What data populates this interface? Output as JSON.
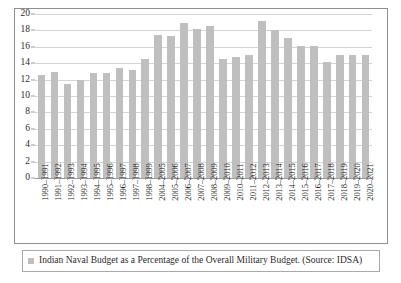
{
  "chart_data": {
    "type": "bar",
    "title": "",
    "xlabel": "",
    "ylabel": "",
    "ylim": [
      0,
      20
    ],
    "yticks": [
      0,
      2,
      4,
      6,
      8,
      10,
      12,
      14,
      16,
      18,
      20
    ],
    "grid": true,
    "legend_position": "bottom",
    "legend": [
      "Indian Naval Budget as a Percentage of the Overall Military Budget. (Source: IDSA)"
    ],
    "series_color": "#bfbfbf",
    "categories": [
      "1990–1991",
      "1991–1992",
      "1992–1993",
      "1993–1994",
      "1994–1995",
      "1995–1996",
      "1996–1997",
      "1997–1998",
      "1998–1999",
      "2004–2005",
      "2005–2006",
      "2006–2007",
      "2007–2008",
      "2008–2009",
      "2009–2010",
      "2010–2011",
      "2011–2012",
      "2012–2013",
      "2013–2014",
      "2014–2015",
      "2015–2016",
      "2016–2017",
      "2017–2018",
      "2018–2019",
      "2019–2020",
      "2020–2021"
    ],
    "values": [
      12.6,
      12.9,
      11.5,
      11.9,
      12.85,
      12.85,
      13.4,
      13.2,
      14.5,
      17.4,
      17.35,
      18.9,
      18.2,
      18.5,
      14.55,
      14.7,
      15.0,
      19.1,
      18.05,
      17.05,
      16.1,
      16.1,
      14.1,
      15.05,
      15.05,
      15.0
    ]
  },
  "legend": {
    "label": "Indian Naval Budget as a Percentage of the Overall Military Budget. (Source: IDSA)"
  }
}
